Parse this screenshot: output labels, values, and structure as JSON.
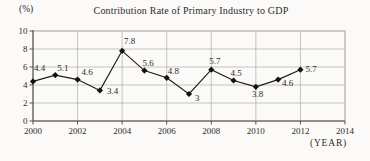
{
  "chart_data": {
    "type": "line",
    "title": "Contribution Rate of Primary Industry to GDP",
    "y_axis_unit": "(%)",
    "x_axis_unit": "(YEAR)",
    "x": [
      2000,
      2001,
      2002,
      2003,
      2004,
      2005,
      2006,
      2007,
      2008,
      2009,
      2010,
      2011,
      2012
    ],
    "values": [
      4.4,
      5.1,
      4.6,
      3.4,
      7.8,
      5.6,
      4.8,
      3,
      5.7,
      4.5,
      3.8,
      4.6,
      5.7
    ],
    "point_labels": [
      "4.4",
      "5.1",
      "4.6",
      "3.4",
      "7.8",
      "5.6",
      "4.8",
      "3",
      "5.7",
      "4.5",
      "3.8",
      "4.6",
      "5.7"
    ],
    "x_ticks": [
      2000,
      2002,
      2004,
      2006,
      2008,
      2010,
      2012,
      2014
    ],
    "y_ticks": [
      0,
      2,
      4,
      6,
      8,
      10
    ],
    "xlim": [
      2000,
      2014
    ],
    "ylim": [
      0,
      10
    ],
    "grid": true,
    "legend": "none",
    "marker": "diamond",
    "colors": {
      "line": "#1e1c1a",
      "marker": "#141210",
      "grid": "#aeaca8",
      "axis": "#55534f",
      "text": "#2d2b29",
      "background": "#fbfaf8"
    },
    "label_offsets": [
      [
        1,
        -10
      ],
      [
        2,
        -4
      ],
      [
        4,
        -5
      ],
      [
        7,
        4
      ],
      [
        2,
        -7
      ],
      [
        -2,
        -5
      ],
      [
        1,
        -4
      ],
      [
        6,
        7
      ],
      [
        -2,
        -6
      ],
      [
        -3,
        -5
      ],
      [
        -4,
        10
      ],
      [
        4,
        6
      ],
      [
        5,
        2
      ]
    ]
  }
}
